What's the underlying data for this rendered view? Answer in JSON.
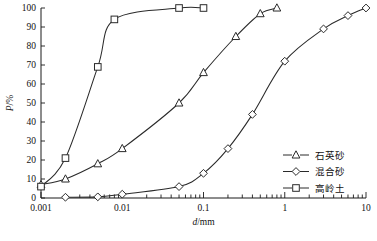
{
  "chart_data": {
    "type": "line",
    "title": "",
    "subtitle": "",
    "xlabel": "d/mm",
    "ylabel": "P/%",
    "xscale": "log",
    "yscale": "linear",
    "xlim": [
      0.001,
      10
    ],
    "ylim": [
      0,
      100
    ],
    "grid": false,
    "legend_position": "bottom-right",
    "x_tick_labels": [
      "0.001",
      "0.01",
      "0.1",
      "1",
      "10"
    ],
    "x_tick_values": [
      0.001,
      0.01,
      0.1,
      1,
      10
    ],
    "y_tick_labels": [
      "0",
      "10",
      "20",
      "30",
      "40",
      "50",
      "60",
      "70",
      "80",
      "90",
      "100"
    ],
    "y_tick_values": [
      0,
      10,
      20,
      30,
      40,
      50,
      60,
      70,
      80,
      90,
      100
    ],
    "series": [
      {
        "name": "石英砂",
        "marker": "triangle",
        "x": [
          0.001,
          0.002,
          0.005,
          0.01,
          0.05,
          0.1,
          0.25,
          0.5,
          0.8
        ],
        "values": [
          7,
          10,
          18,
          26,
          50,
          66,
          85,
          97,
          100
        ]
      },
      {
        "name": "混合砂",
        "marker": "diamond",
        "x": [
          0.002,
          0.005,
          0.01,
          0.05,
          0.1,
          0.2,
          0.4,
          1,
          3,
          6,
          10
        ],
        "values": [
          0.4,
          0.6,
          2,
          6,
          13,
          26,
          44,
          72,
          89,
          96,
          100
        ]
      },
      {
        "name": "高岭土",
        "marker": "square",
        "x": [
          0.001,
          0.002,
          0.005,
          0.008,
          0.05,
          0.1
        ],
        "values": [
          6,
          21,
          69,
          94,
          100,
          100
        ]
      }
    ]
  },
  "legend": {
    "entries": [
      {
        "label": "石英砂",
        "marker": "triangle"
      },
      {
        "label": "混合砂",
        "marker": "diamond"
      },
      {
        "label": "高岭土",
        "marker": "square"
      }
    ]
  },
  "colors": {
    "line": "#2a2a2a",
    "marker_fill": "#ffffff",
    "axis": "#1a1a1a",
    "background": "#ffffff"
  }
}
